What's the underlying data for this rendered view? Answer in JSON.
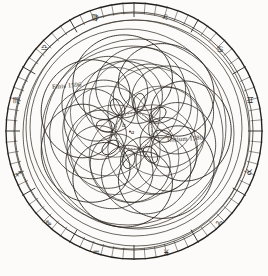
{
  "figure": {
    "medium": "engraved plate, ink on paper",
    "ink_color": "#231f1c",
    "paper_color": "#fcfbf9",
    "faint_ink_color": "#5d554e"
  },
  "annotations": {
    "finis": "Finis 1596",
    "initium": "Initium 1580",
    "center_point_b": "b",
    "center_point_a": "a"
  },
  "center_circle": {
    "style": "dotted",
    "cx": 134,
    "cy": 131,
    "r": 18
  },
  "rim": {
    "outer_radius": 130,
    "inner_radius": 120,
    "tick_count": 72,
    "major_tick_every": 6,
    "zodiac_signs": [
      {
        "name": "leo",
        "glyph": "♌",
        "angle_deg": -70,
        "x": 165,
        "y": 20
      },
      {
        "name": "virgo",
        "glyph": "♍",
        "angle_deg": -110,
        "x": 95,
        "y": 20
      },
      {
        "name": "libra",
        "glyph": "♎",
        "angle_deg": -145,
        "x": 44,
        "y": 50
      },
      {
        "name": "scorpio",
        "glyph": "♏",
        "angle_deg": -175,
        "x": 16,
        "y": 103
      },
      {
        "name": "sagittarius",
        "glyph": "♐",
        "angle_deg": 150,
        "x": 18,
        "y": 177
      },
      {
        "name": "capricorn",
        "glyph": "♑",
        "angle_deg": 120,
        "x": 48,
        "y": 226
      },
      {
        "name": "aquarius",
        "glyph": "♒",
        "angle_deg": 95,
        "x": 96,
        "y": 255
      },
      {
        "name": "pisces",
        "glyph": "♓",
        "angle_deg": 75,
        "x": 166,
        "y": 255
      },
      {
        "name": "aries",
        "glyph": "♈",
        "angle_deg": 40,
        "x": 219,
        "y": 227
      },
      {
        "name": "taurus",
        "glyph": "♉",
        "angle_deg": 8,
        "x": 249,
        "y": 175
      },
      {
        "name": "gemini",
        "glyph": "♊",
        "angle_deg": -20,
        "x": 250,
        "y": 103
      },
      {
        "name": "cancer",
        "glyph": "♋",
        "angle_deg": -48,
        "x": 220,
        "y": 52
      }
    ]
  },
  "chart_data": {
    "type": "line",
    "xlabel": "",
    "ylabel": "",
    "grid": false,
    "legend": false,
    "polar": true,
    "center": [
      134,
      131
    ],
    "series": [
      {
        "name": "epicyclic-path-outer",
        "kind": "rosette",
        "deferent_radius": 96,
        "epicycle_radius": 26,
        "petals": 8,
        "phase_deg": 0,
        "stroke": "#2a2420",
        "stroke_width": 0.9
      },
      {
        "name": "epicyclic-path-mid",
        "kind": "rosette",
        "deferent_radius": 80,
        "epicycle_radius": 24,
        "petals": 8,
        "phase_deg": 22,
        "stroke": "#2a2420",
        "stroke_width": 0.8
      },
      {
        "name": "epicyclic-path-inner",
        "kind": "rosette",
        "deferent_radius": 64,
        "epicycle_radius": 22,
        "petals": 8,
        "phase_deg": 45,
        "stroke": "#2a2420",
        "stroke_width": 0.8
      },
      {
        "name": "petal-loop-ring",
        "kind": "loops",
        "loop_center_radius": 40,
        "loop_radius": 11,
        "count": 8,
        "stroke": "#2a2420",
        "stroke_width": 0.8
      }
    ],
    "orbit_circles": [
      {
        "name": "deferent-1",
        "r": 98,
        "cx_off": -6,
        "cy_off": -4
      },
      {
        "name": "deferent-2",
        "r": 95,
        "cx_off": 5,
        "cy_off": 3
      },
      {
        "name": "deferent-3",
        "r": 91,
        "cx_off": -2,
        "cy_off": 6
      },
      {
        "name": "envelope-outer-a",
        "r": 118,
        "cx_off": -2,
        "cy_off": 0
      },
      {
        "name": "envelope-outer-b",
        "r": 113,
        "cx_off": 2,
        "cy_off": 2
      },
      {
        "name": "envelope-outer-c",
        "r": 108,
        "cx_off": 0,
        "cy_off": -3
      }
    ],
    "axis_ranges": {
      "r": [
        0,
        130
      ],
      "theta_deg": [
        0,
        360
      ]
    },
    "annotations": [
      {
        "text": "Finis 1596",
        "x": 52,
        "y": 88
      },
      {
        "text": "Initium 1580",
        "x": 167,
        "y": 141
      },
      {
        "text": "b",
        "x": 124,
        "y": 126
      },
      {
        "text": "a",
        "x": 133,
        "y": 133
      }
    ]
  }
}
